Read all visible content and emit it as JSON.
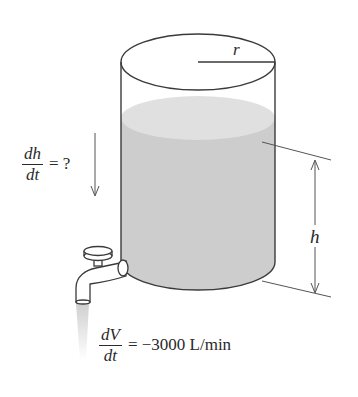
{
  "figure": {
    "type": "related-rates tank diagram",
    "labels": {
      "radius": "r",
      "height": "h"
    },
    "rate_height": {
      "numerator": "dh",
      "denominator": "dt",
      "rhs": "= ?"
    },
    "rate_volume": {
      "numerator": "dV",
      "denominator": "dt",
      "rhs": "= −3000 L/min"
    },
    "colors": {
      "outline": "#3a3a3a",
      "water": "#cfcfcf",
      "water_surface": "#e2e2e2",
      "stream": "#d8d8d8"
    }
  }
}
